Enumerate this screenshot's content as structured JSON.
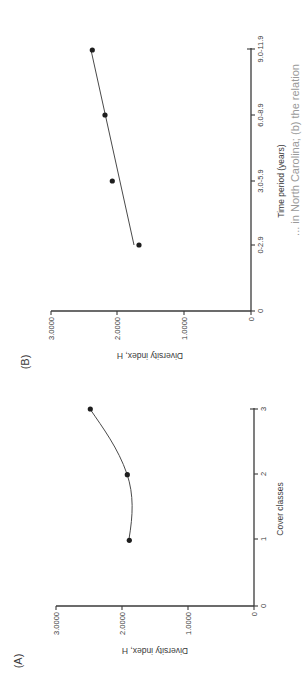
{
  "figure": {
    "orientation": "rotated 90 degrees counter-clockwise",
    "caption_fragment": "... in North Carolina; (b) the relation",
    "panels": [
      {
        "label": "(A)"
      },
      {
        "label": "(B)"
      }
    ]
  },
  "chart_data": [
    {
      "panel": "(A)",
      "type": "line",
      "title": "",
      "xlabel": "Cover classes",
      "ylabel": "Diversity index, H",
      "x_ticks": [
        "0",
        "1",
        "2",
        "3"
      ],
      "y_ticks": [
        "0",
        "1.0000",
        "2.0000",
        "3.0000"
      ],
      "x": [
        1,
        2,
        3
      ],
      "values": [
        1.89,
        1.92,
        2.48
      ],
      "fit": "smooth curve through points (minimum ~1.83 near class 1.5)",
      "xlim": [
        0,
        3
      ],
      "ylim": [
        0,
        3.0
      ],
      "grid": false,
      "legend": "none"
    },
    {
      "panel": "(B)",
      "type": "scatter",
      "title": "",
      "xlabel": "Time period (years)",
      "ylabel": "Diversity index, H",
      "x_ticks": [
        "0",
        "0-2.9",
        "3.0-5.9",
        "6.0-8.9",
        "9.0-11.9"
      ],
      "y_ticks": [
        "0",
        "1.0000",
        "2.0000",
        "3.0000"
      ],
      "categories": [
        "0-2.9",
        "3.0-5.9",
        "6.0-8.9",
        "9.0-11.9"
      ],
      "values": [
        1.68,
        2.08,
        2.19,
        2.38
      ],
      "fit": "linear regression line from ~1.75 (0-2.9) to ~2.40 (9.0-11.9)",
      "ylim": [
        0,
        3.0
      ],
      "grid": false,
      "legend": "none"
    }
  ],
  "labels": {
    "a": {
      "panel": "(A)",
      "xlabel": "Cover classes",
      "ylabel": "Diversity index, H",
      "x_ticks": [
        "0",
        "1",
        "2",
        "3"
      ],
      "y_ticks": [
        "0",
        "1.0000",
        "2.0000",
        "3.0000"
      ]
    },
    "b": {
      "panel": "(B)",
      "xlabel": "Time period (years)",
      "ylabel": "Diversity index, H",
      "x_ticks": [
        "0",
        "0-2.9",
        "3.0-5.9",
        "6.0-8.9",
        "9.0-11.9"
      ],
      "y_ticks": [
        "0",
        "1.0000",
        "2.0000",
        "3.0000"
      ]
    },
    "caption": "... in North Carolina; (b) the relation"
  }
}
